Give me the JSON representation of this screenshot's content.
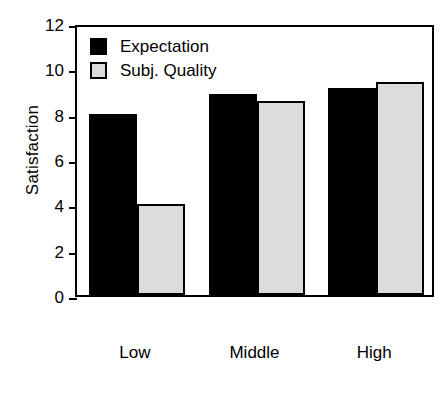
{
  "chart_data": {
    "type": "bar",
    "title": "",
    "xlabel": "",
    "ylabel": "Satisfaction",
    "ylim": [
      0,
      12
    ],
    "yticks": [
      0,
      2,
      4,
      6,
      8,
      10,
      12
    ],
    "grid": false,
    "legend_position": "top-left",
    "categories": [
      "Low",
      "Middle",
      "High"
    ],
    "series": [
      {
        "name": "Expectation",
        "color": "#000000",
        "values": [
          8.0,
          8.85,
          9.15
        ]
      },
      {
        "name": "Subj. Quality",
        "color": "#dcdcdc",
        "values": [
          4.0,
          8.55,
          9.4
        ]
      }
    ]
  },
  "axis": {
    "y_title": "Satisfaction",
    "tick_labels": [
      "12",
      "10",
      "8",
      "6",
      "4",
      "2",
      "0"
    ],
    "category_labels": [
      "Low",
      "Middle",
      "High"
    ]
  },
  "legend": {
    "entries": [
      {
        "label": "Expectation",
        "swatch": "black-square-icon"
      },
      {
        "label": "Subj. Quality",
        "swatch": "gray-square-icon"
      }
    ]
  }
}
